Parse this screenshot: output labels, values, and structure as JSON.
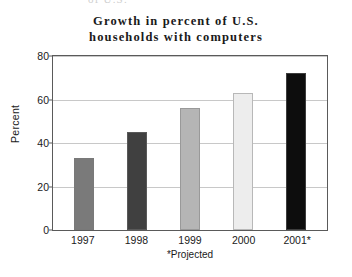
{
  "chart_data": {
    "type": "bar",
    "title": "Growth in percent of U.S. households with computers",
    "title_lines": [
      "Growth in percent of U.S.",
      "households with computers"
    ],
    "categories": [
      "1997",
      "1998",
      "1999",
      "2000",
      "2001*"
    ],
    "values": [
      33,
      45,
      56,
      63,
      72
    ],
    "xlabel": "",
    "ylabel": "Percent",
    "ylim": [
      0,
      80
    ],
    "yticks": [
      0,
      20,
      40,
      60,
      80
    ],
    "ytick_labels": [
      "0",
      "20",
      "40",
      "60",
      "80"
    ],
    "grid": true,
    "legend": false,
    "footnote": "*Projected",
    "bar_colors": [
      "#7a7a7a",
      "#404040",
      "#b5b5b5",
      "#ededed",
      "#0d0d0d"
    ]
  },
  "clipped_top_text": "of U.S.",
  "colors": {
    "background": "#ffffff",
    "axis": "#5a5a5a",
    "gridline": "#c8c8c8",
    "text": "#1a1a1a"
  }
}
